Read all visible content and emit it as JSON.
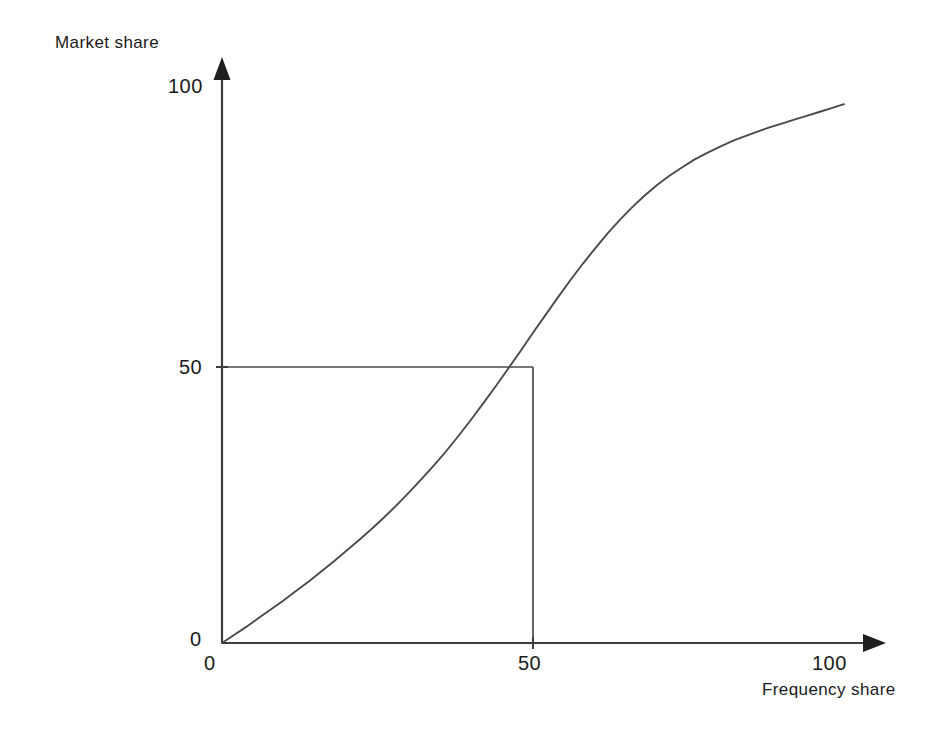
{
  "chart_data": {
    "type": "line",
    "title": "",
    "subtitle": "",
    "xlabel": "Frequency share",
    "ylabel": "Market share",
    "xlim": [
      0,
      107
    ],
    "ylim": [
      0,
      104
    ],
    "grid": false,
    "legend": null,
    "x_ticks": [
      "0",
      "50",
      "100"
    ],
    "x_tick_values": [
      0,
      50,
      100
    ],
    "y_ticks": [
      "0",
      "50",
      "100"
    ],
    "y_tick_values": [
      0,
      50,
      100
    ],
    "series": [
      {
        "name": "Cumulative market share curve",
        "style": "solid",
        "color": "#4a4a4a",
        "x": [
          0,
          2,
          4,
          6,
          8,
          10,
          12,
          14,
          16,
          18,
          20,
          22,
          24,
          26,
          28,
          30,
          32,
          34,
          36,
          38,
          40,
          42,
          44,
          46,
          48,
          50,
          52,
          54,
          56,
          58,
          60,
          62,
          64,
          66,
          68,
          70,
          72,
          74,
          76,
          78,
          80,
          82,
          84,
          86,
          88,
          90,
          92,
          94,
          96,
          98,
          100
        ],
        "y": [
          0,
          1.5,
          3,
          4.6,
          6.2,
          7.8,
          9.5,
          11.2,
          13,
          14.8,
          16.7,
          18.6,
          20.6,
          22.7,
          24.9,
          27.2,
          29.6,
          32.1,
          34.7,
          37.5,
          40.4,
          43.4,
          46.5,
          49.7,
          52.9,
          56.2,
          59.4,
          62.6,
          65.7,
          68.7,
          71.5,
          74.2,
          76.7,
          79,
          81.1,
          83,
          84.7,
          86.2,
          87.6,
          88.8,
          89.9,
          90.9,
          91.8,
          92.6,
          93.4,
          94.1,
          94.8,
          95.5,
          96.2,
          96.9,
          97.6
        ]
      }
    ],
    "annotations": [
      {
        "name": "median-reference-lines",
        "description": "Reference lines marking the 50% frequency share / 50% market share point",
        "x": 50,
        "y": 50
      }
    ]
  },
  "axes": {
    "y_axis_title": "Market share",
    "x_axis_title": "Frequency share",
    "y_tick_top": "100",
    "y_tick_mid": "50",
    "y_tick_zero": "0",
    "x_tick_zero": "0",
    "x_tick_mid": "50",
    "x_tick_max": "100"
  },
  "colors": {
    "background": "#ffffff",
    "axis": "#3d3d3d",
    "curve": "#4a4a4a",
    "reference_line": "#4a4a4a",
    "text": "#1a1a1a"
  }
}
